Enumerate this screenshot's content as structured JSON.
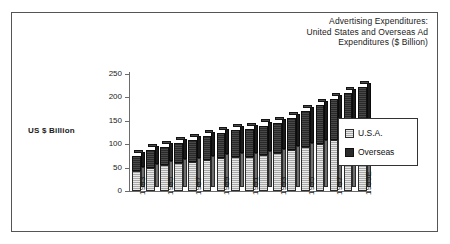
{
  "chart_data": {
    "type": "bar",
    "subtype": "stacked-column-3d",
    "title": "Advertising Expenditures: United States and Overseas Ad Expenditures ($ Billion)",
    "title_lines": [
      "Advertising Expenditures:",
      "United States and Overseas Ad",
      "Expenditures ($ Billion)"
    ],
    "xlabel": "",
    "ylabel": "US $ Billion",
    "ylim": [
      0,
      250
    ],
    "yticks": [
      0,
      50,
      100,
      150,
      200,
      250
    ],
    "ytick_labels": [
      "0",
      "50",
      "100",
      "150",
      "200",
      "250"
    ],
    "grid": false,
    "legend_position": "right",
    "categories": [
      "1983",
      "1984",
      "1985",
      "1986",
      "1987",
      "1988",
      "1989",
      "1990",
      "1991",
      "1992",
      "1993",
      "1994",
      "1995",
      "1996",
      "1997",
      "1998",
      "1999E"
    ],
    "xtick_labels_shown": [
      "1983",
      "1985",
      "1987",
      "1989",
      "1991",
      "1993",
      "1995",
      "1997",
      "1999E"
    ],
    "series": [
      {
        "name": "U.S.A.",
        "color": "#a8a8a8",
        "values": [
          76,
          88,
          95,
          102,
          110,
          118,
          124,
          129,
          128,
          134,
          140,
          150,
          161,
          175,
          188,
          202,
          215
        ]
      },
      {
        "name": "Overseas",
        "color": "#2a2a2a",
        "values": [
          60,
          67,
          70,
          75,
          82,
          89,
          95,
          101,
          103,
          108,
          113,
          122,
          132,
          142,
          152,
          163,
          175
        ]
      }
    ],
    "totals": [
      136,
      155,
      165,
      177,
      192,
      207,
      219,
      230,
      231,
      242,
      253,
      272,
      293,
      317,
      340,
      365,
      390
    ],
    "stacked_tops_rendered": [
      75,
      88,
      95,
      103,
      110,
      118,
      125,
      131,
      133,
      140,
      146,
      157,
      170,
      183,
      196,
      210,
      222
    ]
  },
  "legend": {
    "items": [
      {
        "label": "U.S.A.",
        "swatch": "usa-swatch"
      },
      {
        "label": "Overseas",
        "swatch": "overseas-swatch"
      }
    ]
  },
  "colors": {
    "usa": "#a8a8a8",
    "overseas": "#2a2a2a",
    "axis": "#6b6b6b",
    "frame": "#555555",
    "text": "#1a1a1a",
    "background": "#ffffff"
  }
}
